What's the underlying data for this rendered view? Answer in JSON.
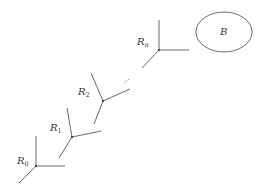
{
  "diagram": {
    "frames": [
      {
        "label": "R",
        "sub": "0"
      },
      {
        "label": "R",
        "sub": "1"
      },
      {
        "label": "R",
        "sub": "2"
      },
      {
        "label": "R",
        "sub": "n"
      }
    ],
    "ellipsis": "...",
    "body": {
      "label": "B"
    }
  }
}
